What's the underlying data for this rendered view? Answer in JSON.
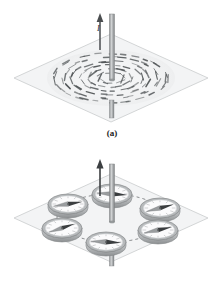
{
  "figure": {
    "type": "physics-illustration",
    "background_color": "#ffffff",
    "panels": [
      {
        "id": "a",
        "caption": "(a)",
        "current_label": "I",
        "description": "Iron filings on a horizontal plane form concentric circles around a vertical current-carrying wire",
        "plane": {
          "fill": "#f3f4f5",
          "stroke": "#c9cbcd",
          "cx": 111,
          "cy": 78,
          "half_width": 97,
          "half_height": 44
        },
        "wire": {
          "color": "#a8abad",
          "edge_color": "#7e8183",
          "x": 112,
          "top_y": 14,
          "bottom_y": 118,
          "width": 5
        },
        "current_arrow": {
          "color": "#4a4d4f",
          "x": 100,
          "tail_y": 50,
          "head_y": 16
        },
        "filings": {
          "color": "#4e5254",
          "rings": [
            0.2,
            0.34,
            0.48,
            0.62,
            0.76,
            0.9
          ],
          "counts": [
            10,
            14,
            18,
            22,
            26,
            30
          ],
          "radius_x": 62,
          "radius_y": 27
        }
      },
      {
        "id": "b",
        "caption": "(b)",
        "current_label": "I",
        "description": "Six compasses placed in a circle around a vertical current-carrying wire; their needles align tangent to the circular magnetic field lines",
        "plane": {
          "fill": "#f3f4f5",
          "stroke": "#c9cbcd",
          "cx": 111,
          "cy": 68,
          "half_width": 97,
          "half_height": 44
        },
        "wire": {
          "color": "#a8abad",
          "edge_color": "#7e8183",
          "x": 112,
          "top_y": 14,
          "bottom_y": 116,
          "width": 5
        },
        "current_arrow": {
          "color": "#3c3f41",
          "x": 100,
          "tail_y": 46,
          "head_y": 12
        },
        "field_circle": {
          "stroke": "#6e7173",
          "dash": "3,3",
          "radius_x": 54,
          "radius_y": 24
        },
        "compasses": [
          {
            "index": 0,
            "position": "top",
            "cx": 112,
            "cy": 44,
            "needle_angle_deg": 8
          },
          {
            "index": 1,
            "position": "upper-right",
            "cx": 160,
            "cy": 58,
            "needle_angle_deg": -28
          },
          {
            "index": 2,
            "position": "lower-right",
            "cx": 158,
            "cy": 80,
            "needle_angle_deg": -24
          },
          {
            "index": 3,
            "position": "bottom",
            "cx": 106,
            "cy": 92,
            "needle_angle_deg": 6
          },
          {
            "index": 4,
            "position": "lower-left",
            "cx": 62,
            "cy": 78,
            "needle_angle_deg": -34
          },
          {
            "index": 5,
            "position": "upper-left",
            "cx": 68,
            "cy": 54,
            "needle_angle_deg": -18
          }
        ],
        "compass_style": {
          "rim_color": "#b7babc",
          "rim_edge_color": "#85888a",
          "face_color": "#fbfbfc",
          "needle_dark": "#3a3d3f",
          "needle_light": "#9a9d9f",
          "tick_color": "#8e9193",
          "radius_x": 20,
          "radius_y": 10,
          "thickness": 4
        }
      }
    ]
  }
}
